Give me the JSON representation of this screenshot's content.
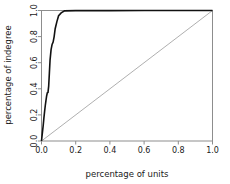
{
  "chart_data": {
    "type": "line",
    "title": "",
    "xlabel": "percentage of units",
    "ylabel": "percentage of indegree",
    "xlim": [
      0.0,
      1.0
    ],
    "ylim": [
      0.0,
      1.0
    ],
    "grid": false,
    "legend": "none",
    "xticks": [
      "0.0",
      "0.2",
      "0.4",
      "0.6",
      "0.8",
      "1.0"
    ],
    "xtick_values": [
      0.0,
      0.2,
      0.4,
      0.6,
      0.8,
      1.0
    ],
    "yticks": [
      "0.0",
      "0.2",
      "0.4",
      "0.6",
      "0.8",
      "1.0"
    ],
    "ytick_values": [
      0.0,
      0.2,
      0.4,
      0.6,
      0.8,
      1.0
    ],
    "series": [
      {
        "name": "concentration curve",
        "color": "#111111",
        "width": 1.6,
        "style": "step",
        "x": [
          0.0,
          0.005,
          0.005,
          0.01,
          0.01,
          0.014,
          0.014,
          0.018,
          0.018,
          0.022,
          0.022,
          0.026,
          0.026,
          0.03,
          0.03,
          0.034,
          0.034,
          0.038,
          0.038,
          0.042,
          0.042,
          0.046,
          0.046,
          0.05,
          0.05,
          0.056,
          0.056,
          0.062,
          0.062,
          0.068,
          0.068,
          0.074,
          0.074,
          0.08,
          0.08,
          0.09,
          0.09,
          0.1,
          0.1,
          0.115,
          0.115,
          0.135,
          0.135,
          0.2,
          0.4,
          0.6,
          0.8,
          1.0
        ],
        "y": [
          0.0,
          0.06,
          0.06,
          0.12,
          0.12,
          0.175,
          0.175,
          0.225,
          0.225,
          0.27,
          0.27,
          0.31,
          0.31,
          0.345,
          0.345,
          0.37,
          0.37,
          0.372,
          0.372,
          0.42,
          0.42,
          0.52,
          0.52,
          0.62,
          0.62,
          0.7,
          0.7,
          0.74,
          0.74,
          0.758,
          0.758,
          0.8,
          0.8,
          0.86,
          0.86,
          0.915,
          0.915,
          0.96,
          0.96,
          0.982,
          0.982,
          0.997,
          0.997,
          0.999,
          0.999,
          1.0,
          1.0,
          1.0
        ]
      },
      {
        "name": "equality diagonal",
        "color": "#9a9a9a",
        "width": 0.8,
        "style": "solid",
        "x": [
          0.0,
          1.0
        ],
        "y": [
          0.0,
          1.0
        ]
      }
    ]
  },
  "axes": {
    "box_color": "#8d8d8d",
    "tick_color": "#8d8d8d"
  }
}
